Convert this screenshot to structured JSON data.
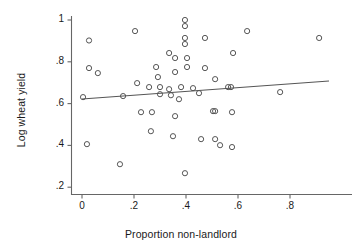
{
  "chart_data": {
    "type": "scatter",
    "title": "",
    "xlabel": "Proportion non-landlord",
    "ylabel": "Log wheat yield",
    "xlim": [
      -0.035,
      1.02
    ],
    "ylim": [
      0.155,
      1.06
    ],
    "xticks": [
      0,
      0.2,
      0.4,
      0.6,
      0.8
    ],
    "xticklabels": [
      "0",
      ".2",
      ".4",
      ".6",
      ".8"
    ],
    "yticks": [
      0.2,
      0.4,
      0.6,
      0.8,
      1.0
    ],
    "yticklabels": [
      ".2",
      ".4",
      ".6",
      ".8",
      "1"
    ],
    "grid": false,
    "legend": null,
    "marker": "open-circle",
    "marker_color": "#555555",
    "points": [
      {
        "x": 0.027,
        "y": 0.902
      },
      {
        "x": 0.204,
        "y": 0.947
      },
      {
        "x": 0.396,
        "y": 1.0
      },
      {
        "x": 0.396,
        "y": 0.971
      },
      {
        "x": 0.396,
        "y": 0.914
      },
      {
        "x": 0.396,
        "y": 0.885
      },
      {
        "x": 0.473,
        "y": 0.914
      },
      {
        "x": 0.635,
        "y": 0.947
      },
      {
        "x": 0.912,
        "y": 0.914
      },
      {
        "x": 0.335,
        "y": 0.842
      },
      {
        "x": 0.581,
        "y": 0.842
      },
      {
        "x": 0.027,
        "y": 0.77
      },
      {
        "x": 0.061,
        "y": 0.746
      },
      {
        "x": 0.285,
        "y": 0.775
      },
      {
        "x": 0.292,
        "y": 0.727
      },
      {
        "x": 0.358,
        "y": 0.751
      },
      {
        "x": 0.404,
        "y": 0.775
      },
      {
        "x": 0.473,
        "y": 0.77
      },
      {
        "x": 0.512,
        "y": 0.717
      },
      {
        "x": 0.212,
        "y": 0.698
      },
      {
        "x": 0.258,
        "y": 0.679
      },
      {
        "x": 0.3,
        "y": 0.679
      },
      {
        "x": 0.335,
        "y": 0.669
      },
      {
        "x": 0.381,
        "y": 0.679
      },
      {
        "x": 0.427,
        "y": 0.674
      },
      {
        "x": 0.562,
        "y": 0.679
      },
      {
        "x": 0.573,
        "y": 0.679
      },
      {
        "x": 0.004,
        "y": 0.631
      },
      {
        "x": 0.158,
        "y": 0.636
      },
      {
        "x": 0.3,
        "y": 0.645
      },
      {
        "x": 0.342,
        "y": 0.64
      },
      {
        "x": 0.373,
        "y": 0.621
      },
      {
        "x": 0.45,
        "y": 0.65
      },
      {
        "x": 0.762,
        "y": 0.655
      },
      {
        "x": 0.227,
        "y": 0.559
      },
      {
        "x": 0.269,
        "y": 0.559
      },
      {
        "x": 0.358,
        "y": 0.54
      },
      {
        "x": 0.504,
        "y": 0.564
      },
      {
        "x": 0.512,
        "y": 0.564
      },
      {
        "x": 0.577,
        "y": 0.559
      },
      {
        "x": 0.265,
        "y": 0.468
      },
      {
        "x": 0.35,
        "y": 0.444
      },
      {
        "x": 0.019,
        "y": 0.406
      },
      {
        "x": 0.458,
        "y": 0.43
      },
      {
        "x": 0.512,
        "y": 0.43
      },
      {
        "x": 0.531,
        "y": 0.401
      },
      {
        "x": 0.577,
        "y": 0.392
      },
      {
        "x": 0.146,
        "y": 0.31
      },
      {
        "x": 0.396,
        "y": 0.267
      },
      {
        "x": 0.358,
        "y": 0.818
      },
      {
        "x": 0.404,
        "y": 0.818
      }
    ],
    "fit_line": {
      "label": "linear fit",
      "x0": 0.0,
      "y0": 0.622,
      "x1": 0.95,
      "y1": 0.708,
      "color": "#555555"
    }
  }
}
